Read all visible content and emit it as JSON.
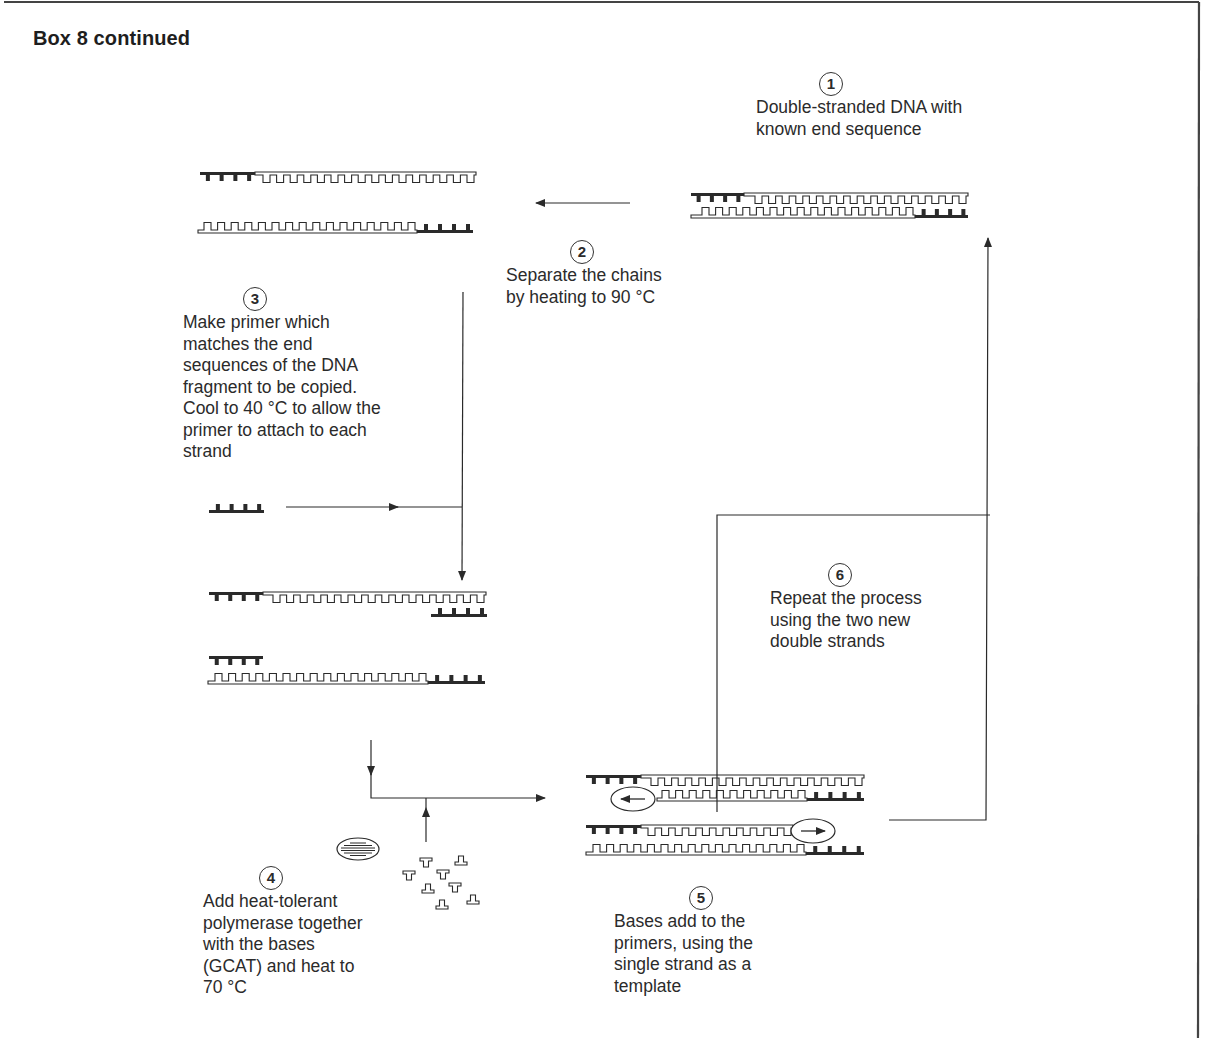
{
  "box": {
    "title": "Box 8 continued"
  },
  "steps": [
    {
      "number": "1",
      "lines": [
        "Double-stranded DNA with",
        "known end sequence"
      ]
    },
    {
      "number": "2",
      "lines": [
        "Separate the chains",
        "by heating to 90 °C"
      ]
    },
    {
      "number": "3",
      "lines": [
        "Make primer which",
        "matches the end",
        "sequences of the DNA",
        "fragment to be copied.",
        "Cool to 40 °C to allow the",
        "primer to attach to each",
        "strand"
      ]
    },
    {
      "number": "4",
      "lines": [
        "Add heat-tolerant",
        "polymerase together",
        "with the  bases",
        "(GCAT) and heat to",
        "70 °C"
      ]
    },
    {
      "number": "5",
      "lines": [
        "Bases add to the",
        "primers, using the",
        "single strand as a",
        "template"
      ]
    },
    {
      "number": "6",
      "lines": [
        "Repeat the process",
        "using the two new",
        "double strands"
      ]
    }
  ],
  "figure": {
    "icons": [
      "dna-double-strand-icon",
      "dna-single-strand-icon",
      "primer-icon",
      "polymerase-icon",
      "free-bases-icon",
      "arrow-icon"
    ],
    "colors": {
      "ink": "#2a2a2a",
      "frame": "#444444",
      "background": "#ffffff"
    }
  }
}
